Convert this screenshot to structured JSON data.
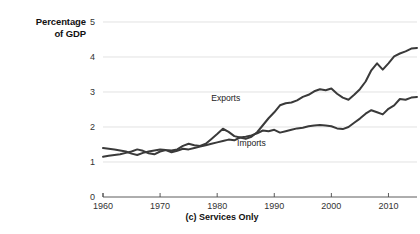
{
  "figure": {
    "y_axis_title_line1": "Percentage",
    "y_axis_title_line2": "of GDP",
    "caption": "(c) Services Only"
  },
  "chart_data": {
    "type": "line",
    "title": "(c) Services Only",
    "xlabel": "",
    "ylabel": "Percentage of GDP",
    "xlim": [
      1960,
      2015
    ],
    "ylim": [
      0,
      5
    ],
    "xticks": [
      1960,
      1970,
      1980,
      1990,
      2000,
      2010
    ],
    "yticks": [
      0,
      1,
      2,
      3,
      4,
      5
    ],
    "grid": "horizontal",
    "legend": "inline-annotations",
    "annotations": [
      {
        "text": "Exports",
        "x": 1981.5,
        "y": 2.75
      },
      {
        "text": "Imports",
        "x": 1986.0,
        "y": 1.45
      }
    ],
    "x": [
      1960,
      1961,
      1962,
      1963,
      1964,
      1965,
      1966,
      1967,
      1968,
      1969,
      1970,
      1971,
      1972,
      1973,
      1974,
      1975,
      1976,
      1977,
      1978,
      1979,
      1980,
      1981,
      1982,
      1983,
      1984,
      1985,
      1986,
      1987,
      1988,
      1989,
      1990,
      1991,
      1992,
      1993,
      1994,
      1995,
      1996,
      1997,
      1998,
      1999,
      2000,
      2001,
      2002,
      2003,
      2004,
      2005,
      2006,
      2007,
      2008,
      2009,
      2010,
      2011,
      2012,
      2013,
      2014,
      2015
    ],
    "series": [
      {
        "name": "Exports",
        "values": [
          1.4,
          1.38,
          1.36,
          1.33,
          1.3,
          1.24,
          1.2,
          1.26,
          1.3,
          1.33,
          1.36,
          1.34,
          1.33,
          1.36,
          1.46,
          1.52,
          1.48,
          1.46,
          1.52,
          1.66,
          1.8,
          1.95,
          1.86,
          1.74,
          1.7,
          1.66,
          1.72,
          1.85,
          2.05,
          2.25,
          2.42,
          2.62,
          2.68,
          2.7,
          2.76,
          2.86,
          2.92,
          3.02,
          3.08,
          3.05,
          3.1,
          2.95,
          2.84,
          2.78,
          2.92,
          3.08,
          3.3,
          3.62,
          3.82,
          3.64,
          3.82,
          4.02,
          4.1,
          4.16,
          4.24,
          4.26
        ]
      },
      {
        "name": "Imports",
        "values": [
          1.15,
          1.18,
          1.2,
          1.22,
          1.26,
          1.3,
          1.36,
          1.32,
          1.25,
          1.22,
          1.3,
          1.34,
          1.28,
          1.32,
          1.38,
          1.36,
          1.4,
          1.44,
          1.48,
          1.52,
          1.56,
          1.6,
          1.64,
          1.62,
          1.7,
          1.72,
          1.76,
          1.82,
          1.9,
          1.88,
          1.92,
          1.84,
          1.88,
          1.92,
          1.96,
          1.98,
          2.02,
          2.04,
          2.06,
          2.04,
          2.02,
          1.96,
          1.94,
          2.0,
          2.12,
          2.24,
          2.38,
          2.48,
          2.42,
          2.36,
          2.52,
          2.62,
          2.8,
          2.78,
          2.84,
          2.86
        ]
      }
    ]
  }
}
